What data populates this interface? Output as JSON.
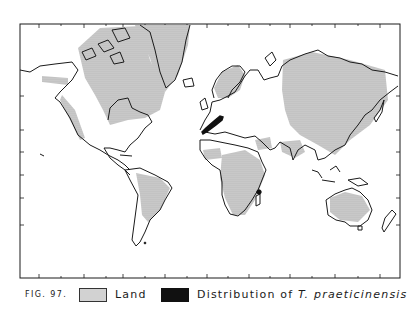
{
  "figure": {
    "number_label": "FIG. 97.",
    "projection": "Mercator world map",
    "frame": {
      "left": 20,
      "top": 24,
      "right": 400,
      "bottom": 278
    }
  },
  "legend": {
    "items": [
      {
        "key": "land",
        "label": "Land",
        "swatch": "stippled-gray"
      },
      {
        "key": "distribution",
        "label_prefix": "Distribution of ",
        "label_species": "T. praeticinensis",
        "swatch": "solid-black"
      }
    ]
  },
  "colors": {
    "background": "#ffffff",
    "outline": "#1a1a1a",
    "land_fill": "#d2d2d2",
    "land_stipple": "#8a8a8a",
    "distribution": "#111111"
  },
  "ticks": {
    "bottom_x": [
      39,
      61,
      84,
      106,
      123,
      145,
      165,
      187,
      207,
      228,
      249,
      270,
      290,
      312,
      335,
      358,
      380
    ],
    "top_x": [
      39,
      61,
      84,
      106,
      123,
      145,
      165,
      187,
      207,
      228,
      249,
      270,
      290,
      312,
      335,
      358,
      380
    ],
    "left_y": [
      96,
      130,
      152,
      175,
      198,
      225
    ],
    "right_y": [
      96,
      130,
      152,
      175,
      198,
      225
    ]
  },
  "distribution_areas": [
    {
      "name": "western-europe-range",
      "region": "Iberia to central Europe"
    },
    {
      "name": "madagascar-record",
      "region": "Madagascar (east Africa)"
    }
  ]
}
